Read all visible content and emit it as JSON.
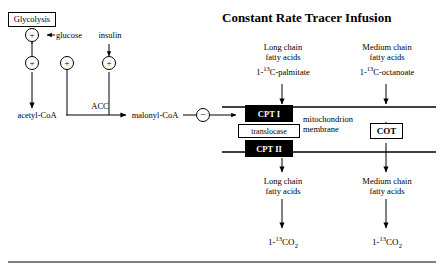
{
  "figure": {
    "title": "Constant Rate Tracer Infusion",
    "labels": {
      "glycolysis": "Glycolysis",
      "glucose": "glucose",
      "insulin": "insulin",
      "acetyl_coa": "acetyl-CoA",
      "acc": "ACC",
      "malonyl_coa": "malonyl-CoA",
      "cpt1": "CPT I",
      "cpt2": "CPT II",
      "translocase": "translocase",
      "cot": "COT",
      "mitochondrion_membrane": "mitochondrion\nmembrane",
      "long_chain_top": "Long chain\nfatty acids",
      "palmitate_tracer_pre": "1-",
      "palmitate_tracer_iso": "13",
      "palmitate_tracer_post": "C-palmitate",
      "medium_chain_top": "Medium chain\nfatty acids",
      "octanoate_tracer_pre": "1-",
      "octanoate_tracer_iso": "13",
      "octanoate_tracer_post": "C-octanoate",
      "long_chain_bottom": "Long chain\nfatty acids",
      "medium_chain_bottom": "Medium chain\nfatty acids",
      "co2_left_pre": "1-",
      "co2_left_iso": "13",
      "co2_left_post": "CO",
      "co2_left_sub": "2",
      "co2_right_pre": "1-",
      "co2_right_iso": "13",
      "co2_right_post": "CO",
      "co2_right_sub": "2",
      "plus_1": "+",
      "plus_2": "+",
      "plus_3": "+",
      "plus_4": "+",
      "minus_1": "−"
    },
    "colors": {
      "ink": "#000000",
      "paper": "#ffffff",
      "box_fill": "#000000",
      "box_text": "#ffffff"
    }
  }
}
